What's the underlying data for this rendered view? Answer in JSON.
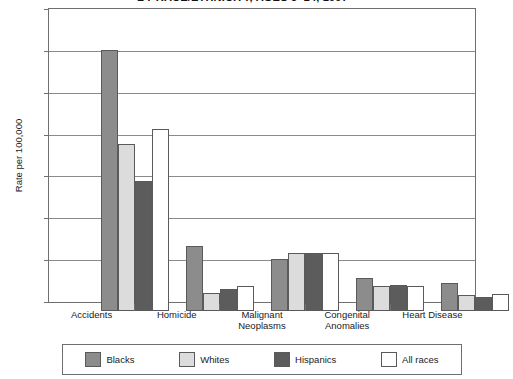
{
  "chart_data": {
    "type": "bar",
    "title": "BY RACE/ETHNICITY, AGES 5–14, 1997",
    "xlabel": "",
    "ylabel": "Rate per 100,000",
    "ylim": [
      0,
      14
    ],
    "yticks": [
      0,
      2,
      4,
      6,
      8,
      10,
      12,
      14
    ],
    "ytick_labels": [
      "0",
      "2",
      "4",
      "6",
      "8",
      "10",
      "12",
      "14"
    ],
    "grid": true,
    "legend_position": "bottom",
    "categories": [
      "Accidents",
      "Malignant Neoplasms",
      "Homicide",
      "Congenital Anomalies",
      "Heart Disease"
    ],
    "category_lines": [
      [
        "Accidents"
      ],
      [
        "Homicide"
      ],
      [
        "Malignant",
        "Neoplasms"
      ],
      [
        "Congenital",
        "Anomalies"
      ],
      [
        "Heart Disease"
      ]
    ],
    "category_order": [
      "Accidents",
      "Homicide",
      "Malignant Neoplasms",
      "Congenital Anomalies",
      "Heart Disease"
    ],
    "series": [
      {
        "name": "Blacks",
        "color": "#8c8c8c",
        "values": [
          12.45,
          3.1,
          2.5,
          1.6,
          1.35
        ]
      },
      {
        "name": "Whites",
        "color": "#dcdcdc",
        "values": [
          8.0,
          0.85,
          2.75,
          1.2,
          0.75
        ]
      },
      {
        "name": "Hispanics",
        "color": "#5c5c5c",
        "values": [
          6.2,
          1.05,
          2.75,
          1.25,
          0.65
        ]
      },
      {
        "name": "All races",
        "color": "#ffffff",
        "values": [
          8.7,
          1.2,
          2.75,
          1.2,
          0.8
        ]
      }
    ]
  },
  "legend": {
    "items": [
      {
        "label": "Blacks"
      },
      {
        "label": "Whites"
      },
      {
        "label": "Hispanics"
      },
      {
        "label": "All races"
      }
    ]
  }
}
